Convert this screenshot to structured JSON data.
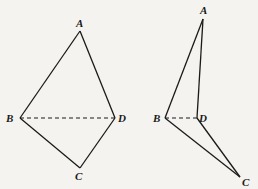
{
  "figures": [
    {
      "name": "planar-quadrilateral",
      "vertices": {
        "A": {
          "label": "A",
          "x": 80,
          "y": 31,
          "lx": 76,
          "ly": 27
        },
        "B": {
          "label": "B",
          "x": 20,
          "y": 118,
          "lx": 6,
          "ly": 122
        },
        "C": {
          "label": "C",
          "x": 80,
          "y": 168,
          "lx": 75,
          "ly": 180
        },
        "D": {
          "label": "D",
          "x": 115,
          "y": 118,
          "lx": 118,
          "ly": 122
        }
      },
      "solid_edges": [
        [
          "A",
          "B"
        ],
        [
          "A",
          "D"
        ],
        [
          "B",
          "C"
        ],
        [
          "C",
          "D"
        ]
      ],
      "dashed_edges": [
        [
          "B",
          "D"
        ]
      ]
    },
    {
      "name": "folded-quadrilateral",
      "vertices": {
        "A": {
          "label": "A",
          "x": 203,
          "y": 19,
          "lx": 200,
          "ly": 14
        },
        "B": {
          "label": "B",
          "x": 165,
          "y": 118,
          "lx": 153,
          "ly": 122
        },
        "C": {
          "label": "C",
          "x": 240,
          "y": 177,
          "lx": 242,
          "ly": 186
        },
        "D": {
          "label": "D",
          "x": 197,
          "y": 118,
          "lx": 199,
          "ly": 122
        }
      },
      "solid_edges": [
        [
          "A",
          "B"
        ],
        [
          "A",
          "D"
        ],
        [
          "B",
          "C"
        ],
        [
          "C",
          "D"
        ]
      ],
      "dashed_edges": [
        [
          "B",
          "D"
        ]
      ]
    }
  ],
  "colors": {
    "ink": "#1a1a1a",
    "paper": "#f4f3ef"
  }
}
